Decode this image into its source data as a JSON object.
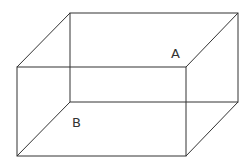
{
  "diagram": {
    "type": "rectangular-prism-wireframe",
    "labels": {
      "a": "A",
      "b": "B"
    },
    "colors": {
      "background": "#ffffff",
      "stroke": "#333333"
    }
  }
}
